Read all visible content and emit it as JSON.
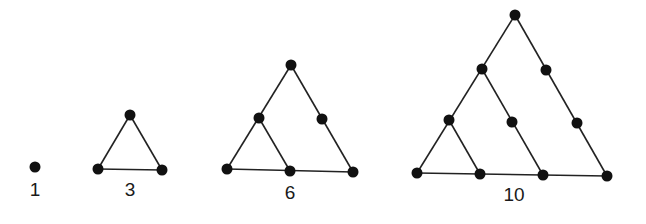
{
  "figures": [
    {
      "label": "1",
      "label_pos": [
        35,
        196
      ],
      "dots": [
        [
          35,
          167
        ]
      ],
      "edges": []
    },
    {
      "label": "3",
      "label_pos": [
        130,
        196
      ],
      "dots": [
        [
          130,
          115
        ],
        [
          98,
          169
        ],
        [
          162,
          170
        ]
      ],
      "edges": [
        [
          0,
          1
        ],
        [
          0,
          2
        ],
        [
          1,
          2
        ]
      ]
    },
    {
      "label": "6",
      "label_pos": [
        290,
        199
      ],
      "dots": [
        [
          291,
          65
        ],
        [
          259,
          118
        ],
        [
          322,
          119
        ],
        [
          227,
          169
        ],
        [
          290,
          171
        ],
        [
          353,
          172
        ]
      ],
      "edges": [
        [
          0,
          3
        ],
        [
          0,
          5
        ],
        [
          3,
          5
        ],
        [
          1,
          4
        ]
      ]
    },
    {
      "label": "10",
      "label_pos": [
        514,
        201
      ],
      "dots": [
        [
          515,
          15
        ],
        [
          482,
          69
        ],
        [
          546,
          70
        ],
        [
          449,
          120
        ],
        [
          512,
          122
        ],
        [
          577,
          123
        ],
        [
          417,
          173
        ],
        [
          480,
          174
        ],
        [
          543,
          175
        ],
        [
          607,
          176
        ]
      ],
      "edges": [
        [
          0,
          6
        ],
        [
          0,
          9
        ],
        [
          6,
          9
        ],
        [
          1,
          8
        ],
        [
          3,
          7
        ]
      ]
    }
  ],
  "style": {
    "dot_color": "#111111",
    "line_color": "#222222",
    "dot_radius": 5.5,
    "line_width": 1.6
  }
}
